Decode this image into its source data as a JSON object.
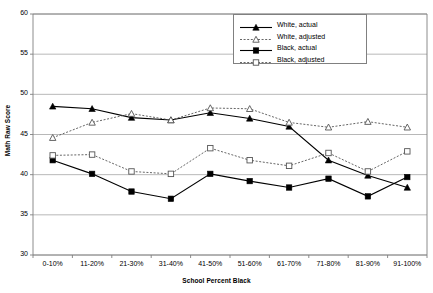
{
  "chart_data": {
    "type": "line",
    "title": "",
    "xlabel": "School Percent Black",
    "ylabel": "Math Raw Score",
    "categories": [
      "0-10%",
      "11-20%",
      "21-30%",
      "31-40%",
      "41-50%",
      "51-60%",
      "61-70%",
      "71-80%",
      "81-90%",
      "91-100%"
    ],
    "ylim": [
      30,
      60
    ],
    "yticks": [
      30,
      35,
      40,
      45,
      50,
      55,
      60
    ],
    "grid": "horizontal",
    "legend_position": "top-right",
    "series": [
      {
        "name": "White, actual",
        "marker": "triangle-filled",
        "line": "solid",
        "color": "#000000",
        "values": [
          48.5,
          48.2,
          47.1,
          46.8,
          47.7,
          47.0,
          46.0,
          41.8,
          39.9,
          38.4
        ]
      },
      {
        "name": "White, adjusted",
        "marker": "triangle-open",
        "line": "dotted",
        "color": "#555555",
        "values": [
          44.6,
          46.5,
          47.6,
          46.8,
          48.3,
          48.2,
          46.5,
          45.9,
          46.6,
          45.9
        ]
      },
      {
        "name": "Black, actual",
        "marker": "square-filled",
        "line": "solid",
        "color": "#000000",
        "values": [
          41.8,
          40.1,
          37.9,
          37.0,
          40.1,
          39.2,
          38.4,
          39.5,
          37.3,
          39.7
        ]
      },
      {
        "name": "Black, adjusted",
        "marker": "square-open",
        "line": "dotted",
        "color": "#555555",
        "values": [
          42.4,
          42.5,
          40.4,
          40.1,
          43.3,
          41.8,
          41.1,
          42.7,
          40.4,
          42.9
        ]
      }
    ]
  },
  "axis": {
    "ylabel": "Math Raw Score",
    "xlabel": "School Percent Black",
    "ytick_labels": [
      "60",
      "55",
      "50",
      "45",
      "40",
      "35",
      "30"
    ],
    "xtick_labels": [
      "0-10%",
      "11-20%",
      "21-30%",
      "31-40%",
      "41-50%",
      "51-60%",
      "61-70%",
      "71-80%",
      "81-90%",
      "91-100%"
    ]
  },
  "legend": {
    "entries": [
      {
        "label": "White, actual"
      },
      {
        "label": "White, adjusted"
      },
      {
        "label": "Black, actual"
      },
      {
        "label": "Black, adjusted"
      }
    ]
  },
  "colors": {
    "axis": "#808080",
    "grid": "#a6a6a6",
    "solid_series": "#000000",
    "dotted_series": "#555555",
    "background": "#ffffff"
  }
}
